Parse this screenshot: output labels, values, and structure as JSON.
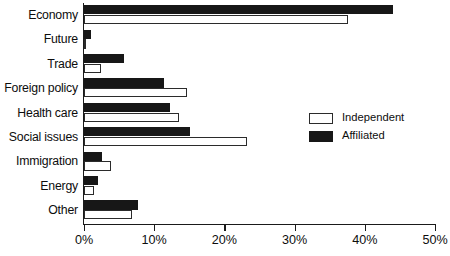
{
  "chart_data": {
    "type": "bar",
    "orientation": "horizontal",
    "title": "",
    "subtitle": "",
    "xlabel": "",
    "ylabel": "",
    "xlim": [
      0,
      50
    ],
    "xticks": [
      "0%",
      "10%",
      "20%",
      "30%",
      "40%",
      "50%"
    ],
    "xtick_values": [
      0,
      10,
      20,
      30,
      40,
      50
    ],
    "grid": false,
    "legend_position": "center-right",
    "categories": [
      "Economy",
      "Future",
      "Trade",
      "Foreign policy",
      "Health care",
      "Social issues",
      "Immigration",
      "Energy",
      "Other"
    ],
    "series": [
      {
        "name": "Independent",
        "color": "#ffffff",
        "edge_color": "#2b2b2b",
        "values": [
          37.6,
          0.3,
          2.4,
          14.7,
          13.5,
          23.2,
          3.8,
          1.4,
          6.8
        ]
      },
      {
        "name": "Affiliated",
        "color": "#171717",
        "edge_color": "#171717",
        "values": [
          44.0,
          1.0,
          5.7,
          11.4,
          12.3,
          15.1,
          2.6,
          2.0,
          7.7
        ]
      }
    ]
  },
  "legend": {
    "items": [
      {
        "label": "Independent",
        "style": "independent"
      },
      {
        "label": "Affiliated",
        "style": "affiliated"
      }
    ]
  }
}
